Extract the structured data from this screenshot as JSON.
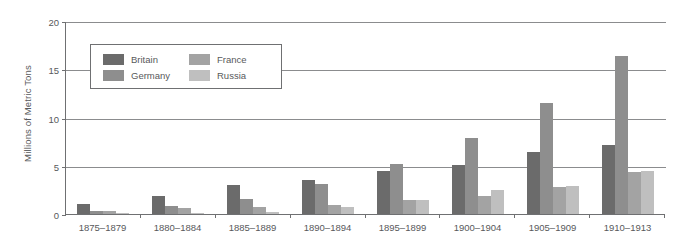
{
  "chart_data": {
    "type": "bar",
    "title": "",
    "subtitle": "",
    "xlabel": "",
    "ylabel": "Millions of Metric Tons",
    "categories": [
      "1875–1879",
      "1880–1884",
      "1885–1889",
      "1890–1894",
      "1895–1899",
      "1900–1904",
      "1905–1909",
      "1910–1913"
    ],
    "series": [
      {
        "name": "Britain",
        "color": "#6b6b6b",
        "values": [
          1.0,
          1.9,
          3.0,
          3.5,
          4.5,
          5.1,
          6.4,
          7.2
        ]
      },
      {
        "name": "Germany",
        "color": "#8e8e8e",
        "values": [
          0.3,
          0.8,
          1.6,
          3.1,
          5.2,
          7.9,
          11.5,
          16.4
        ]
      },
      {
        "name": "France",
        "color": "#a3a3a3",
        "values": [
          0.3,
          0.6,
          0.7,
          0.9,
          1.5,
          1.9,
          2.8,
          4.4
        ]
      },
      {
        "name": "Russia",
        "color": "#bfbfbf",
        "values": [
          0.1,
          0.15,
          0.2,
          0.7,
          1.5,
          2.5,
          2.9,
          4.5
        ]
      }
    ],
    "ylim": [
      0,
      20
    ],
    "yticks": [
      0,
      5,
      10,
      15,
      20
    ],
    "ytick_labels": [
      "0",
      "5",
      "10",
      "15",
      "20"
    ],
    "grid": true,
    "legend_position": "inside-upper-left",
    "legend_entries": [
      "Britain",
      "Germany",
      "France",
      "Russia"
    ]
  }
}
